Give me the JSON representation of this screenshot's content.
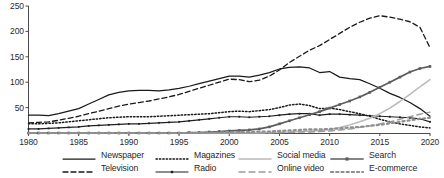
{
  "chart_data": {
    "type": "line",
    "title": "",
    "subtitle": "",
    "xlabel": "",
    "ylabel": "",
    "xlim": [
      1980,
      2020
    ],
    "ylim": [
      0,
      250
    ],
    "yticks": [
      50,
      100,
      150,
      200,
      250
    ],
    "xticks": [
      1980,
      1985,
      1990,
      1995,
      2000,
      2005,
      2010,
      2015,
      2020
    ],
    "grid": false,
    "legend_position": "bottom",
    "x": [
      1980,
      1981,
      1982,
      1983,
      1984,
      1985,
      1986,
      1987,
      1988,
      1989,
      1990,
      1991,
      1992,
      1993,
      1994,
      1995,
      1996,
      1997,
      1998,
      1999,
      2000,
      2001,
      2002,
      2003,
      2004,
      2005,
      2006,
      2007,
      2008,
      2009,
      2010,
      2011,
      2012,
      2013,
      2014,
      2015,
      2016,
      2017,
      2018,
      2019,
      2020
    ],
    "series": [
      {
        "name": "Newspaper",
        "style": "solid",
        "color": "#1a1a1a",
        "values": [
          35,
          35,
          34,
          38,
          43,
          48,
          57,
          66,
          75,
          80,
          83,
          84,
          84,
          83,
          85,
          88,
          92,
          97,
          102,
          107,
          112,
          112,
          110,
          114,
          119,
          126,
          129,
          130,
          128,
          119,
          121,
          110,
          107,
          105,
          97,
          88,
          78,
          70,
          60,
          48,
          33
        ]
      },
      {
        "name": "Television",
        "style": "dashed",
        "color": "#1a1a1a",
        "values": [
          20,
          21,
          22,
          25,
          29,
          33,
          38,
          43,
          48,
          53,
          57,
          60,
          63,
          67,
          71,
          76,
          82,
          88,
          94,
          100,
          106,
          105,
          101,
          104,
          112,
          124,
          139,
          151,
          163,
          172,
          184,
          196,
          208,
          218,
          226,
          231,
          228,
          224,
          219,
          208,
          168
        ]
      },
      {
        "name": "Magazines",
        "style": "dotted",
        "color": "#1a1a1a",
        "values": [
          18,
          18,
          19,
          20,
          22,
          24,
          26,
          28,
          30,
          31,
          32,
          32,
          32,
          33,
          34,
          35,
          36,
          37,
          38,
          40,
          42,
          43,
          42,
          44,
          46,
          50,
          55,
          57,
          54,
          48,
          49,
          46,
          42,
          38,
          33,
          27,
          22,
          18,
          15,
          12,
          10
        ]
      },
      {
        "name": "Radio",
        "style": "solid-marker",
        "color": "#1f1f1f",
        "values": [
          8,
          8,
          9,
          10,
          11,
          12,
          14,
          15,
          16,
          17,
          18,
          18,
          19,
          20,
          21,
          22,
          24,
          26,
          28,
          30,
          32,
          32,
          31,
          32,
          33,
          35,
          37,
          38,
          38,
          35,
          37,
          37,
          36,
          35,
          34,
          33,
          32,
          31,
          30,
          28,
          22
        ]
      },
      {
        "name": "Social media",
        "style": "solid-light",
        "color": "#b9b9b9",
        "values": [
          0,
          0,
          0,
          0,
          0,
          0,
          0,
          0,
          0,
          0,
          0,
          0,
          0,
          0,
          0,
          0,
          0,
          0,
          0,
          0,
          0,
          0,
          0,
          0,
          1,
          1,
          2,
          3,
          4,
          5,
          7,
          11,
          16,
          22,
          29,
          38,
          49,
          62,
          76,
          91,
          105
        ]
      },
      {
        "name": "Search",
        "style": "solid-dark-marker",
        "color": "#5d5d5d",
        "values": [
          0,
          0,
          0,
          0,
          0,
          0,
          0,
          0,
          0,
          0,
          0,
          0,
          0,
          0,
          0,
          0,
          1,
          1,
          2,
          3,
          4,
          5,
          6,
          8,
          12,
          18,
          24,
          30,
          36,
          42,
          49,
          56,
          63,
          71,
          80,
          90,
          100,
          110,
          120,
          127,
          131
        ]
      },
      {
        "name": "Online video",
        "style": "dashed-gray",
        "color": "#9a9a9a",
        "values": [
          0,
          0,
          0,
          0,
          0,
          0,
          0,
          0,
          0,
          0,
          0,
          0,
          0,
          0,
          0,
          0,
          0,
          0,
          0,
          0,
          0,
          0,
          0,
          0,
          0,
          1,
          1,
          2,
          2,
          3,
          4,
          6,
          8,
          11,
          14,
          18,
          22,
          27,
          32,
          37,
          41
        ]
      },
      {
        "name": "E-commerce",
        "style": "dotted-gray",
        "color": "#8f8f8f",
        "values": [
          0,
          0,
          0,
          0,
          0,
          0,
          0,
          0,
          0,
          0,
          0,
          0,
          0,
          0,
          0,
          0,
          0,
          0,
          1,
          1,
          2,
          2,
          2,
          3,
          3,
          4,
          5,
          6,
          7,
          7,
          8,
          9,
          11,
          12,
          14,
          16,
          19,
          22,
          25,
          28,
          30
        ]
      }
    ]
  },
  "axis": {
    "y_tick_labels": [
      "250",
      "200",
      "150",
      "100",
      "50"
    ],
    "x_tick_labels": [
      "1980",
      "1985",
      "1990",
      "1995",
      "2000",
      "2005",
      "2010",
      "2015",
      "2020"
    ]
  },
  "legend": {
    "column1": [
      {
        "label": "Newspaper",
        "swatch": "solid"
      },
      {
        "label": "Television",
        "swatch": "dashed"
      }
    ],
    "column2": [
      {
        "label": "Magazines",
        "swatch": "dotted"
      },
      {
        "label": "Radio",
        "swatch": "solid-marker"
      }
    ],
    "column3": [
      {
        "label": "Social media",
        "swatch": "solid-light"
      },
      {
        "label": "Online video",
        "swatch": "dashed-gray"
      }
    ],
    "column4": [
      {
        "label": "Search",
        "swatch": "solid-dark-marker"
      },
      {
        "label": "E-commerce",
        "swatch": "dotted-gray"
      }
    ]
  }
}
